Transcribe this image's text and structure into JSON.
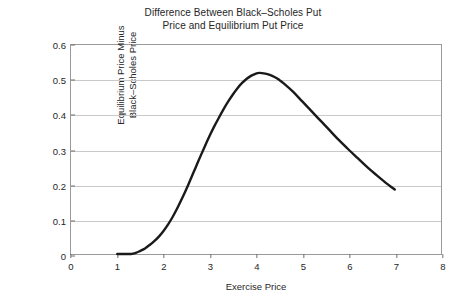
{
  "chart_data": {
    "type": "line",
    "title": "Difference Between Black–Scholes Put\nPrice and Equilibrium Put Price",
    "xlabel": "Exercise Price",
    "ylabel": "Equilibrium Price Minus\nBlack–Scholes Price",
    "xlim": [
      0,
      8
    ],
    "ylim": [
      0,
      0.6
    ],
    "xticks": [
      "0",
      "1",
      "2",
      "3",
      "4",
      "5",
      "6",
      "7",
      "8"
    ],
    "xtick_values": [
      0,
      1,
      2,
      3,
      4,
      5,
      6,
      7,
      8
    ],
    "yticks": [
      "0",
      "0.1",
      "0.2",
      "0.3",
      "0.4",
      "0.5",
      "0.6"
    ],
    "ytick_values": [
      0,
      0.1,
      0.2,
      0.3,
      0.4,
      0.5,
      0.6
    ],
    "grid": "horizontal",
    "legend": "none",
    "series": [
      {
        "name": "Equilibrium Price Minus Black–Scholes Price",
        "color": "#1a1a1a",
        "line_width": 2.4,
        "x": [
          1.0,
          1.15,
          1.3,
          1.4,
          1.5,
          1.6,
          1.7,
          1.8,
          1.9,
          2.0,
          2.1,
          2.2,
          2.3,
          2.4,
          2.5,
          2.6,
          2.7,
          2.8,
          2.9,
          3.0,
          3.1,
          3.2,
          3.3,
          3.4,
          3.5,
          3.6,
          3.7,
          3.8,
          3.9,
          4.0,
          4.07,
          4.2,
          4.3,
          4.4,
          4.5,
          4.6,
          4.8,
          5.0,
          5.2,
          5.4,
          5.6,
          5.8,
          6.0,
          6.2,
          6.4,
          6.6,
          6.8,
          7.0
        ],
        "y": [
          0.0,
          0.0,
          0.0,
          0.003,
          0.009,
          0.016,
          0.026,
          0.037,
          0.05,
          0.066,
          0.085,
          0.107,
          0.132,
          0.159,
          0.188,
          0.219,
          0.25,
          0.281,
          0.311,
          0.34,
          0.367,
          0.392,
          0.416,
          0.438,
          0.458,
          0.476,
          0.491,
          0.503,
          0.512,
          0.518,
          0.52,
          0.518,
          0.514,
          0.508,
          0.5,
          0.49,
          0.466,
          0.438,
          0.41,
          0.382,
          0.354,
          0.326,
          0.3,
          0.275,
          0.25,
          0.227,
          0.205,
          0.185
        ]
      }
    ],
    "annotations": {
      "peak_x": 4.07,
      "peak_y": 0.52,
      "zero_until_x": 1.4,
      "end_x": 7.0,
      "end_y": 0.185
    }
  },
  "colors": {
    "background": "#ffffff",
    "curve": "#1a1a1a",
    "gridline": "#c9c9c9",
    "frame": "#9a9a9a",
    "text": "#262626"
  }
}
